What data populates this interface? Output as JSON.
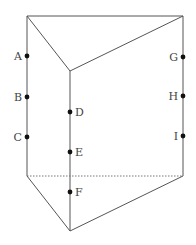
{
  "diagram": {
    "type": "triangular-prism",
    "vertices": {
      "top_left": [
        27,
        16
      ],
      "top_right": [
        183,
        16
      ],
      "top_front": [
        70,
        71
      ],
      "bottom_left": [
        27,
        176
      ],
      "bottom_right": [
        183,
        176
      ],
      "bottom_front": [
        70,
        231
      ]
    },
    "points": [
      {
        "label": "A",
        "x": 27,
        "y": 56,
        "side": "left"
      },
      {
        "label": "B",
        "x": 27,
        "y": 97,
        "side": "left"
      },
      {
        "label": "C",
        "x": 27,
        "y": 137,
        "side": "left"
      },
      {
        "label": "D",
        "x": 70,
        "y": 112,
        "side": "right"
      },
      {
        "label": "E",
        "x": 70,
        "y": 152,
        "side": "right"
      },
      {
        "label": "F",
        "x": 70,
        "y": 192,
        "side": "right"
      },
      {
        "label": "G",
        "x": 183,
        "y": 57,
        "side": "left"
      },
      {
        "label": "H",
        "x": 183,
        "y": 96,
        "side": "left"
      },
      {
        "label": "I",
        "x": 183,
        "y": 136,
        "side": "left"
      }
    ]
  }
}
